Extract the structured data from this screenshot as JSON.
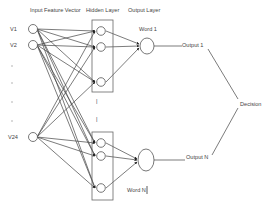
{
  "headers": {
    "input": "Input Feature Vector",
    "hidden": "Hidden Layer",
    "output": "Output Layer"
  },
  "inputs": [
    {
      "label": "V1",
      "x": 33,
      "y": 29
    },
    {
      "label": "V2",
      "x": 33,
      "y": 45
    },
    {
      "label": "V24",
      "x": 33,
      "y": 137
    }
  ],
  "input_ellipsis_dots": [
    {
      "label": ".",
      "y": 66
    },
    {
      "label": ".",
      "y": 83
    },
    {
      "label": ".",
      "y": 102
    },
    {
      "label": ".",
      "y": 121
    }
  ],
  "hidden_groups": [
    {
      "name": "Word 1",
      "nodes": [
        [
          101,
          31
        ],
        [
          101,
          47
        ],
        [
          101,
          82
        ]
      ]
    },
    {
      "name": "Word N",
      "nodes": [
        [
          101,
          143
        ],
        [
          101,
          156
        ],
        [
          101,
          188
        ]
      ]
    }
  ],
  "hidden_ellipsis": [
    "|",
    "|"
  ],
  "outputs": [
    {
      "word_label": "Word 1",
      "output_label": "Output 1"
    },
    {
      "word_label": "Word N",
      "output_label": "Output N"
    }
  ],
  "decision_label": "Decision",
  "colors": {
    "line": "#444444",
    "text": "#444444",
    "background": "#ffffff"
  }
}
